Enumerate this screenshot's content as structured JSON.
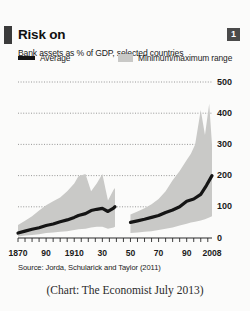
{
  "header": {
    "title": "Risk on",
    "subtitle": "Bank assets as % of GDP, selected countries",
    "badge": "1",
    "brand_color": "#3b3b3b"
  },
  "legend": {
    "position": "top",
    "items": [
      {
        "label": "Average",
        "marker": "line",
        "color": "#151515"
      },
      {
        "label": "Minimum/maximum range",
        "marker": "band",
        "color": "#c9c9c7"
      }
    ]
  },
  "footer": {
    "source": "Source: Jorda, Schularick and Taylor (2011)",
    "caption": "(Chart: The Economist July 2013)"
  },
  "chart_data": {
    "type": "area",
    "title": "Risk on",
    "subtitle": "Bank assets as % of GDP, selected countries",
    "xlabel": "",
    "ylabel": "Bank assets as % of GDP",
    "xlim": [
      1870,
      2008
    ],
    "ylim": [
      0,
      500
    ],
    "yticks": [
      0,
      100,
      200,
      300,
      400,
      500
    ],
    "ytick_labels": [
      "0",
      "100",
      "200",
      "300",
      "400",
      "500"
    ],
    "xticks": [
      1870,
      1890,
      1910,
      1930,
      1950,
      1970,
      1990,
      2008
    ],
    "xtick_labels": [
      "1870",
      "90",
      "1910",
      "30",
      "50",
      "70",
      "90",
      "2008"
    ],
    "grid": "horizontal-dotted",
    "break": {
      "from": 1939,
      "to": 1946,
      "note": "series gap (second world war)"
    },
    "series": [
      {
        "name": "Average",
        "type": "line",
        "color": "#151515",
        "x": [
          1870,
          1875,
          1880,
          1885,
          1890,
          1895,
          1900,
          1905,
          1910,
          1913,
          1918,
          1922,
          1926,
          1930,
          1934,
          1938,
          1939,
          1946,
          1950,
          1955,
          1960,
          1965,
          1970,
          1975,
          1980,
          1985,
          1990,
          1995,
          2000,
          2004,
          2008
        ],
        "values": [
          16,
          22,
          28,
          33,
          40,
          45,
          52,
          58,
          66,
          72,
          78,
          88,
          92,
          95,
          85,
          96,
          100,
          null,
          50,
          55,
          60,
          66,
          72,
          82,
          90,
          100,
          118,
          125,
          140,
          168,
          200
        ]
      },
      {
        "name": "Minimum/maximum range",
        "type": "band",
        "color": "#c9c9c7",
        "x": [
          1870,
          1875,
          1880,
          1885,
          1890,
          1895,
          1900,
          1905,
          1910,
          1913,
          1918,
          1922,
          1926,
          1930,
          1934,
          1938,
          1939,
          1946,
          1950,
          1955,
          1960,
          1965,
          1970,
          1975,
          1980,
          1985,
          1990,
          1993,
          1996,
          2000,
          2003,
          2006,
          2008
        ],
        "min": [
          5,
          8,
          10,
          12,
          16,
          18,
          20,
          22,
          26,
          28,
          30,
          34,
          36,
          36,
          30,
          34,
          36,
          null,
          16,
          18,
          20,
          22,
          26,
          30,
          34,
          40,
          46,
          50,
          52,
          56,
          60,
          66,
          70
        ],
        "max": [
          42,
          55,
          70,
          88,
          105,
          118,
          130,
          150,
          175,
          198,
          205,
          150,
          175,
          205,
          120,
          155,
          160,
          null,
          75,
          85,
          95,
          108,
          125,
          150,
          185,
          215,
          250,
          270,
          300,
          410,
          330,
          430,
          300
        ]
      }
    ]
  }
}
